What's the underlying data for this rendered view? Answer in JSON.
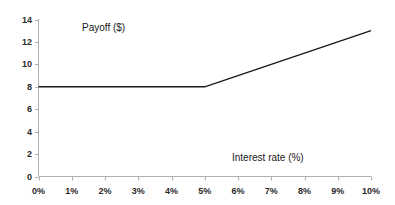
{
  "chart_data": {
    "type": "line",
    "title": "",
    "xlabel": "Interest rate (%)",
    "ylabel": "Payoff ($)",
    "xlim": [
      0,
      10
    ],
    "ylim": [
      0,
      14
    ],
    "grid": false,
    "legend": null,
    "x_tick_labels": [
      "0%",
      "1%",
      "2%",
      "3%",
      "4%",
      "5%",
      "6%",
      "7%",
      "8%",
      "9%",
      "10%"
    ],
    "x_tick_values": [
      0,
      1,
      2,
      3,
      4,
      5,
      6,
      7,
      8,
      9,
      10
    ],
    "y_tick_labels": [
      "0",
      "2",
      "4",
      "6",
      "8",
      "10",
      "12",
      "14"
    ],
    "y_tick_values": [
      0,
      2,
      4,
      6,
      8,
      10,
      12,
      14
    ],
    "series": [
      {
        "name": "Payoff",
        "color": "#1a1a1a",
        "x": [
          0,
          1,
          2,
          3,
          4,
          5,
          6,
          7,
          8,
          9,
          10
        ],
        "values": [
          8,
          8,
          8,
          8,
          8,
          8,
          9,
          10,
          11,
          12,
          13
        ]
      }
    ],
    "kink_point": {
      "x": 5,
      "y": 8
    },
    "end_point": {
      "x": 10,
      "y": 13
    }
  },
  "figure": {
    "axis_color": "#b0b0b0",
    "line_color": "#1a1a1a",
    "background": "#ffffff"
  }
}
